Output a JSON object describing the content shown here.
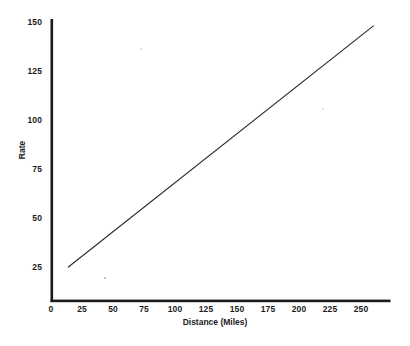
{
  "chart_data": {
    "type": "line",
    "title": "",
    "xlabel": "Distance (Miles)",
    "ylabel": "Rate",
    "xlim": [
      0,
      272
    ],
    "ylim": [
      0,
      153
    ],
    "grid": false,
    "legend": null,
    "xticks": [
      "0",
      "25",
      "50",
      "75",
      "100",
      "125",
      "150",
      "175",
      "200",
      "225",
      "250"
    ],
    "xtick_values": [
      0,
      25,
      50,
      75,
      100,
      125,
      150,
      175,
      200,
      225,
      250
    ],
    "yticks": [
      "25",
      "50",
      "75",
      "100",
      "125",
      "150"
    ],
    "ytick_values": [
      25,
      50,
      75,
      100,
      125,
      150
    ],
    "series": [
      {
        "name": "Rate vs Distance",
        "color": "#2b2b2b",
        "relation": "rate = 18 + 0.5 * distance",
        "x": [
          14,
          40,
          60,
          80,
          100,
          120,
          140,
          160,
          180,
          200,
          220,
          240,
          260
        ],
        "values": [
          25,
          38,
          48,
          58,
          68,
          78,
          88,
          98,
          108,
          118,
          128,
          138,
          148
        ]
      }
    ],
    "endpoints": {
      "start": {
        "x": 14,
        "y": 25
      },
      "end": {
        "x": 260,
        "y": 148
      }
    }
  },
  "axes": {
    "axis_color": "#1b1b1b",
    "x_axis_title": "Distance (Miles)",
    "y_axis_title": "Rate"
  },
  "colors": {
    "background": "#ffffff",
    "line": "#2b2b2b",
    "text": "#1b1b1b"
  }
}
